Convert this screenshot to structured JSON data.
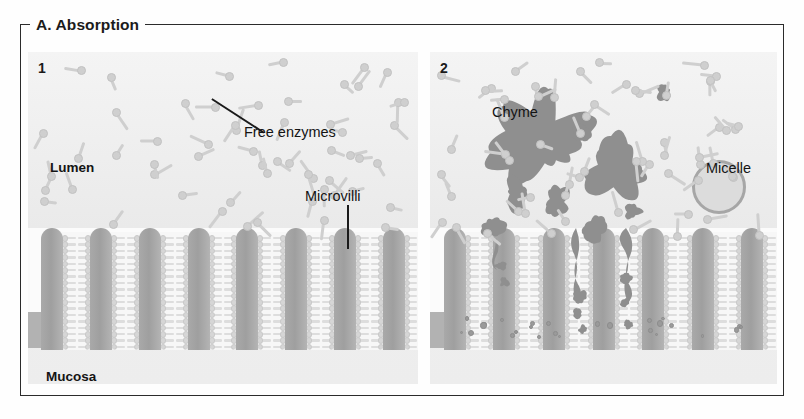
{
  "figure": {
    "title": "A. Absorption",
    "type": "biological-diagram",
    "accent_colors": {
      "villus_gray": "#a9a9a9",
      "mucosa_gray": "#b2b2b2",
      "chyme_gray": "#8f8f8f",
      "enzyme_gray": "#cfcfcf",
      "micelle_fill": "#dcdcdc",
      "micelle_ring": "#a6a6a6",
      "frame_black": "#2b2b2b",
      "panel_background": "#f2f2f2"
    }
  },
  "panels": [
    {
      "number": "1",
      "caption_labels": [
        "Free enzymes",
        "Lumen",
        "Microvilli",
        "Mucosa"
      ],
      "description": "Free enzymes dispersed in the lumen above intact microvilli"
    },
    {
      "number": "2",
      "caption_labels": [
        "Chyme",
        "Micelle"
      ],
      "description": "Chyme broken into fragments with micelle formation and nutrient uptake into mucosa"
    }
  ],
  "labels": {
    "free_enzymes": "Free enzymes",
    "lumen": "Lumen",
    "microvilli": "Microvilli",
    "mucosa_p1": "Mucosa",
    "chyme": "Chyme",
    "micelle": "Micelle"
  }
}
